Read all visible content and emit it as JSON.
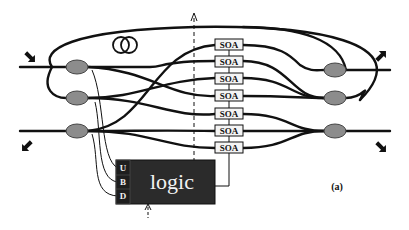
{
  "diagram": {
    "type": "optical switch schematic",
    "figure_label": "(a)",
    "colors": {
      "fiber": "#111111",
      "coupler_fill": "#8c8c8c",
      "logic_fill": "#2b2b2b",
      "port_fill": "#1e1e1e",
      "soa_fill": "#f4f4f4"
    },
    "soa": {
      "label": "SOA",
      "count": 7,
      "items": [
        "SOA",
        "SOA",
        "SOA",
        "SOA",
        "SOA",
        "SOA",
        "SOA"
      ]
    },
    "logic": {
      "label": "logic",
      "ports": [
        "U",
        "B",
        "D"
      ]
    },
    "inputs": {
      "left_couplers": 3,
      "right_couplers": 3
    },
    "arrows": {
      "top_left": "input-arrow",
      "bottom_left": "input-arrow",
      "top_right": "output-arrow",
      "bottom_right": "output-arrow"
    },
    "fiber_coil": "delay-loop"
  }
}
